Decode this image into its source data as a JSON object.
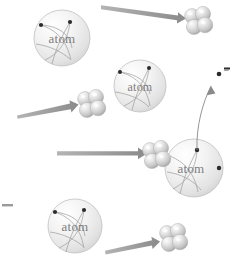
{
  "figure": {
    "background_color": "#ffffff",
    "width": 238,
    "height": 267,
    "label_color": "#7d7d7d",
    "arrow_color": "#8f8f8f",
    "sphere_color": "#d9d9d9",
    "electron_color": "#2b2b2b"
  },
  "atoms": [
    {
      "id": "atom-1",
      "label": "atom",
      "cx": 62,
      "cy": 38,
      "r": 28
    },
    {
      "id": "atom-2",
      "label": "atom",
      "cx": 140,
      "cy": 86,
      "r": 26
    },
    {
      "id": "atom-3",
      "label": "atom",
      "cx": 194,
      "cy": 168,
      "r": 29
    },
    {
      "id": "atom-4",
      "label": "atom",
      "cx": 75,
      "cy": 226,
      "r": 27
    }
  ],
  "alpha_particles": [
    {
      "id": "alpha-1",
      "cx": 197,
      "cy": 21
    },
    {
      "id": "alpha-2",
      "cx": 90,
      "cy": 104
    },
    {
      "id": "alpha-3",
      "cx": 155,
      "cy": 155
    },
    {
      "id": "alpha-4",
      "cx": 170,
      "cy": 238
    }
  ],
  "arrows": [
    {
      "id": "arrow-1",
      "x1": 101,
      "y1": 7,
      "x2": 184,
      "y2": 18
    },
    {
      "id": "arrow-2",
      "x1": 17,
      "y1": 113,
      "x2": 78,
      "y2": 100
    },
    {
      "id": "arrow-3",
      "x1": 57,
      "y1": 153,
      "x2": 145,
      "y2": 153
    },
    {
      "id": "arrow-4",
      "x1": 105,
      "y1": 249,
      "x2": 158,
      "y2": 237
    }
  ],
  "ejected_electron": {
    "id": "ejected-electron",
    "charge_symbol": "–",
    "dot_x": 219,
    "dot_y": 74,
    "trail_start_x": 197,
    "trail_start_y": 150
  },
  "left_dash": {
    "id": "left-dash",
    "x": 2,
    "y": 205,
    "width": 11
  }
}
